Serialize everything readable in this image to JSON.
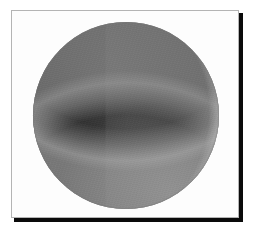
{
  "document": {
    "kind": "framed-photograph",
    "title": "Shaded sphere photograph",
    "alt_text": "Grayscale photograph of a dark sphere lit from the right, showing a bright crescent limb",
    "width_px": 255,
    "height_px": 237,
    "background_color": "#ffffff"
  },
  "frame": {
    "name": "photo-frame",
    "border_color": "#b4b4b4",
    "border_width_px": 1,
    "fill_color": "#fdfdfd",
    "left_px": 11,
    "top_px": 10,
    "width_px": 228,
    "height_px": 208
  },
  "shadow": {
    "color": "#0a0a0a",
    "right_edge_width_px": 4,
    "bottom_edge_height_px": 4,
    "offset_px": 4
  },
  "subject": {
    "name": "sphere",
    "shape": "circle",
    "center_x_px": 126,
    "center_y_px": 115,
    "diameter_px": 186,
    "bbox": {
      "x1": 33,
      "y1": 22,
      "x2": 218,
      "y2": 208
    },
    "body_color": "#303030",
    "body_color_dark": "#1c1c1c",
    "body_color_light": "#484848",
    "limb_highlight_color": "#bebebe",
    "top_arc_color": "#8c8c8c",
    "bottom_arc_color": "#b2b2b2",
    "terminator_x_px": 93,
    "illumination_direction": "right",
    "regions": [
      {
        "name": "dark-body",
        "tone": "#303030",
        "description": "large dark disc occupying most of the circle"
      },
      {
        "name": "terminator-band",
        "tone": "#3a3a3a",
        "description": "vertical tone step right of the terminator"
      },
      {
        "name": "right-limb-crescent",
        "tone": "#bebebe",
        "description": "bright crescent hugging the right edge"
      },
      {
        "name": "top-rim-arc",
        "tone": "#8c8c8c",
        "description": "soft gray arc along the upper rim"
      },
      {
        "name": "bottom-rim-arc",
        "tone": "#b2b2b2",
        "description": "light arc along the lower rim"
      },
      {
        "name": "left-limb-shadow",
        "tone": "#1c1c1c",
        "description": "darkened extreme left limb"
      }
    ]
  }
}
